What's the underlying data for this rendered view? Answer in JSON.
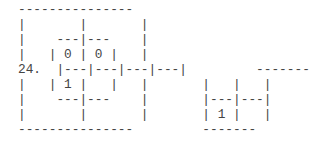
{
  "item": {
    "number_label": "24.",
    "lines": [
      "---------------",
      "|       |       |",
      "|    ---|---    |",
      "|   | 0 | 0 |   |",
      "24.  |---|---|---|---|         -------",
      "|   | 1 |   |   |       |   |   |",
      "|    ---|---    |       |---|---|",
      "|       |       |       | 1 |   |",
      "---------------         -------"
    ],
    "cell_values": {
      "left_figure": {
        "top_left": "0",
        "top_right": "0",
        "bottom_left": "1",
        "bottom_right": ""
      },
      "right_figure": {
        "top_left": "",
        "top_right": "",
        "bottom_left": "1",
        "bottom_right": ""
      }
    }
  },
  "colors": {
    "text": "#444444",
    "background": "#ffffff"
  }
}
